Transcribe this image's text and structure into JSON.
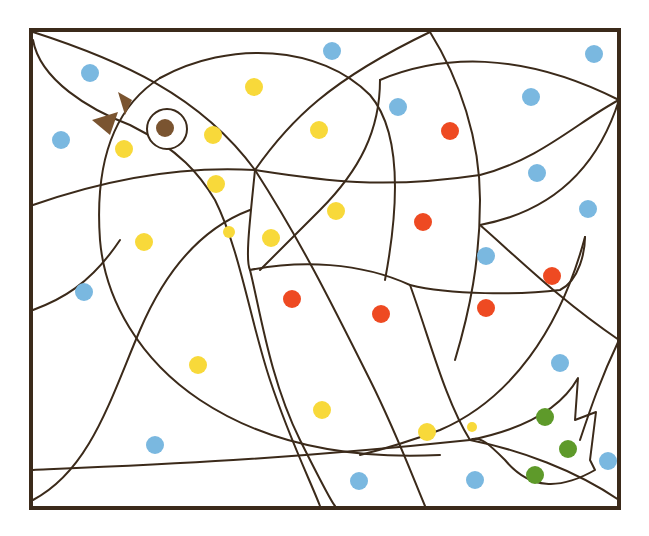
{
  "illustration": {
    "title": "Color-by-dot bird",
    "frame": {
      "x": 31,
      "y": 30,
      "w": 588,
      "h": 478
    },
    "palette": {
      "line": "#3b2a1a",
      "blue": "#7ab8e0",
      "yellow": "#f8d93a",
      "red": "#ee4a22",
      "green": "#5e9a2a",
      "brown": "#7a5430"
    },
    "eye": {
      "cx": 167,
      "cy": 129,
      "r_outer": 20,
      "r_pupil": 9
    },
    "beak": "brown-triangles",
    "dots": [
      {
        "cx": 90,
        "cy": 73,
        "color": "blue"
      },
      {
        "cx": 61,
        "cy": 140,
        "color": "blue"
      },
      {
        "cx": 332,
        "cy": 51,
        "color": "blue"
      },
      {
        "cx": 398,
        "cy": 107,
        "color": "blue"
      },
      {
        "cx": 594,
        "cy": 54,
        "color": "blue"
      },
      {
        "cx": 531,
        "cy": 97,
        "color": "blue"
      },
      {
        "cx": 537,
        "cy": 173,
        "color": "blue"
      },
      {
        "cx": 588,
        "cy": 209,
        "color": "blue"
      },
      {
        "cx": 486,
        "cy": 256,
        "color": "blue"
      },
      {
        "cx": 84,
        "cy": 292,
        "color": "blue"
      },
      {
        "cx": 560,
        "cy": 363,
        "color": "blue"
      },
      {
        "cx": 155,
        "cy": 445,
        "color": "blue"
      },
      {
        "cx": 359,
        "cy": 481,
        "color": "blue"
      },
      {
        "cx": 475,
        "cy": 480,
        "color": "blue"
      },
      {
        "cx": 608,
        "cy": 461,
        "color": "blue"
      },
      {
        "cx": 254,
        "cy": 87,
        "color": "yellow"
      },
      {
        "cx": 124,
        "cy": 149,
        "color": "yellow"
      },
      {
        "cx": 213,
        "cy": 135,
        "color": "yellow"
      },
      {
        "cx": 319,
        "cy": 130,
        "color": "yellow"
      },
      {
        "cx": 216,
        "cy": 184,
        "color": "yellow"
      },
      {
        "cx": 336,
        "cy": 211,
        "color": "yellow"
      },
      {
        "cx": 229,
        "cy": 232,
        "color": "yellow",
        "r": 6
      },
      {
        "cx": 271,
        "cy": 238,
        "color": "yellow"
      },
      {
        "cx": 144,
        "cy": 242,
        "color": "yellow"
      },
      {
        "cx": 198,
        "cy": 365,
        "color": "yellow"
      },
      {
        "cx": 322,
        "cy": 410,
        "color": "yellow"
      },
      {
        "cx": 427,
        "cy": 432,
        "color": "yellow"
      },
      {
        "cx": 472,
        "cy": 427,
        "color": "yellow",
        "r": 5
      },
      {
        "cx": 450,
        "cy": 131,
        "color": "red"
      },
      {
        "cx": 423,
        "cy": 222,
        "color": "red"
      },
      {
        "cx": 552,
        "cy": 276,
        "color": "red"
      },
      {
        "cx": 292,
        "cy": 299,
        "color": "red"
      },
      {
        "cx": 381,
        "cy": 314,
        "color": "red"
      },
      {
        "cx": 486,
        "cy": 308,
        "color": "red"
      },
      {
        "cx": 545,
        "cy": 417,
        "color": "green"
      },
      {
        "cx": 568,
        "cy": 449,
        "color": "green"
      },
      {
        "cx": 535,
        "cy": 475,
        "color": "green"
      }
    ]
  }
}
